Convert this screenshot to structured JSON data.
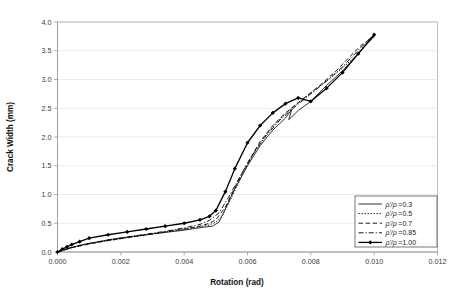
{
  "chart_data": {
    "type": "line",
    "title": "",
    "xlabel": "Rotation (rad)",
    "ylabel": "Crack Width (mm)",
    "xlim": [
      0.0,
      0.012
    ],
    "ylim": [
      0.0,
      4.0
    ],
    "xticks": [
      "0.000",
      "0.002",
      "0.004",
      "0.006",
      "0.008",
      "0.010",
      "0.012"
    ],
    "xtick_values": [
      0.0,
      0.002,
      0.004,
      0.006,
      0.008,
      0.01,
      0.012
    ],
    "yticks": [
      "0.0",
      "0.5",
      "1.0",
      "1.5",
      "2.0",
      "2.5",
      "3.0",
      "3.5",
      "4.0"
    ],
    "ytick_values": [
      0.0,
      0.5,
      1.0,
      1.5,
      2.0,
      2.5,
      3.0,
      3.5,
      4.0
    ],
    "grid": "horizontal",
    "legend_position": "bottom-right",
    "series": [
      {
        "name": "rho'/rho =0.3",
        "label_prefix": "ρ'/ρ",
        "label_value": "=0.3",
        "style": "solid",
        "marker": "none",
        "stroke_width": 0.8,
        "dash": "",
        "x": [
          0.0,
          0.0002,
          0.0004,
          0.0006,
          0.0009,
          0.0012,
          0.0017,
          0.0022,
          0.0028,
          0.0034,
          0.004,
          0.0046,
          0.0049,
          0.0051,
          0.0053,
          0.0056,
          0.006,
          0.0064,
          0.0068,
          0.0072,
          0.0074,
          0.0073,
          0.0076,
          0.008,
          0.0085,
          0.009,
          0.0095,
          0.01
        ],
        "y": [
          0.0,
          0.04,
          0.07,
          0.1,
          0.14,
          0.17,
          0.22,
          0.26,
          0.3,
          0.34,
          0.38,
          0.43,
          0.45,
          0.52,
          0.75,
          1.1,
          1.5,
          1.85,
          2.12,
          2.33,
          2.48,
          2.3,
          2.46,
          2.62,
          2.9,
          3.15,
          3.45,
          3.75
        ]
      },
      {
        "name": "rho'/rho =0.5",
        "label_prefix": "ρ'/ρ",
        "label_value": "=0.5",
        "style": "dotted",
        "marker": "none",
        "stroke_width": 0.9,
        "dash": "1.4,1.6",
        "x": [
          0.0,
          0.0004,
          0.0009,
          0.0014,
          0.002,
          0.0026,
          0.0032,
          0.0038,
          0.0044,
          0.0048,
          0.005,
          0.0052,
          0.0055,
          0.0058,
          0.0062,
          0.0066,
          0.007,
          0.0074,
          0.0078,
          0.0082,
          0.0086,
          0.009,
          0.0094,
          0.0098,
          0.01
        ],
        "y": [
          0.0,
          0.07,
          0.13,
          0.18,
          0.23,
          0.28,
          0.33,
          0.38,
          0.43,
          0.47,
          0.52,
          0.62,
          0.95,
          1.3,
          1.72,
          2.05,
          2.3,
          2.5,
          2.68,
          2.85,
          3.02,
          3.2,
          3.4,
          3.65,
          3.75
        ]
      },
      {
        "name": "rho'/rho =0.7",
        "label_prefix": "ρ'/ρ",
        "label_value": "=0.7",
        "style": "dashed",
        "marker": "none",
        "stroke_width": 0.9,
        "dash": "4.5,2.6",
        "x": [
          0.0,
          0.0005,
          0.001,
          0.0016,
          0.0022,
          0.0028,
          0.0034,
          0.004,
          0.0045,
          0.0048,
          0.005,
          0.0053,
          0.0056,
          0.006,
          0.0064,
          0.0068,
          0.0072,
          0.0076,
          0.008,
          0.0084,
          0.0088,
          0.0092,
          0.0096,
          0.01
        ],
        "y": [
          0.0,
          0.08,
          0.14,
          0.2,
          0.25,
          0.3,
          0.35,
          0.4,
          0.45,
          0.5,
          0.56,
          0.78,
          1.12,
          1.55,
          1.92,
          2.2,
          2.42,
          2.6,
          2.77,
          2.95,
          3.15,
          3.38,
          3.6,
          3.75
        ]
      },
      {
        "name": "rho'/rho =0.85",
        "label_prefix": "ρ'/ρ",
        "label_value": "=0.85",
        "style": "dashdot",
        "marker": "none",
        "stroke_width": 0.9,
        "dash": "5,2,1.2,2",
        "x": [
          0.0,
          0.0005,
          0.001,
          0.0016,
          0.0022,
          0.0028,
          0.0034,
          0.004,
          0.0045,
          0.0048,
          0.0051,
          0.0054,
          0.0058,
          0.0062,
          0.0066,
          0.007,
          0.0074,
          0.0078,
          0.0082,
          0.0086,
          0.009,
          0.0094,
          0.0098,
          0.01
        ],
        "y": [
          0.0,
          0.09,
          0.15,
          0.21,
          0.26,
          0.31,
          0.36,
          0.42,
          0.48,
          0.55,
          0.68,
          0.95,
          1.35,
          1.72,
          2.03,
          2.28,
          2.48,
          2.66,
          2.84,
          3.02,
          3.22,
          3.45,
          3.68,
          3.78
        ]
      },
      {
        "name": "rho'/rho =1.00",
        "label_prefix": "ρ'/ρ",
        "label_value": "=1.00",
        "style": "solid",
        "marker": "diamond",
        "stroke_width": 1.3,
        "dash": "",
        "x": [
          0.0,
          0.00015,
          0.0003,
          0.00045,
          0.0007,
          0.001,
          0.0016,
          0.0022,
          0.0028,
          0.0034,
          0.004,
          0.0045,
          0.0048,
          0.005,
          0.0053,
          0.0056,
          0.006,
          0.0064,
          0.0068,
          0.0072,
          0.0076,
          0.008,
          0.0085,
          0.009,
          0.0095,
          0.01
        ],
        "y": [
          0.0,
          0.05,
          0.09,
          0.13,
          0.18,
          0.24,
          0.3,
          0.35,
          0.4,
          0.45,
          0.5,
          0.56,
          0.62,
          0.72,
          1.05,
          1.45,
          1.9,
          2.2,
          2.42,
          2.58,
          2.68,
          2.62,
          2.85,
          3.12,
          3.45,
          3.78
        ]
      }
    ]
  },
  "colors": {
    "series": "#000000",
    "grid": "#e2e2e2",
    "frame": "#b9b9b9",
    "text": "#1a1a1a",
    "background": "#ffffff"
  }
}
